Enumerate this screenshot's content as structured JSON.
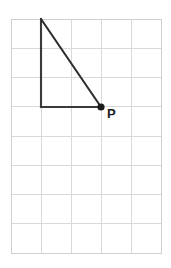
{
  "figure": {
    "background_color": "#ffffff",
    "grid": {
      "columns": 5,
      "rows": 8,
      "cell_width": 30,
      "cell_height": 29.25,
      "origin_x": 11,
      "origin_y": 19,
      "line_color": "#d9d9d9",
      "border_color": "#cfcfcf"
    },
    "shape": {
      "name": "right triangle",
      "stroke_color": "#3a3a3a",
      "stroke_width": 2.1,
      "vertices": [
        {
          "name": "apex",
          "x": 41,
          "y": 19,
          "grid_col": 1,
          "grid_row": 0,
          "labeled": false,
          "label": ""
        },
        {
          "name": "right-angle-corner",
          "x": 41,
          "y": 107,
          "grid_col": 1,
          "grid_row": 3,
          "labeled": false,
          "label": ""
        },
        {
          "name": "point-p",
          "x": 101,
          "y": 107,
          "grid_col": 3,
          "grid_row": 3,
          "labeled": true,
          "label": "P"
        }
      ],
      "legs": {
        "vertical_length_cells": 3,
        "horizontal_length_cells": 2
      }
    },
    "labels": [
      {
        "name": "point-p-label",
        "text": "P",
        "x": 107,
        "y": 108,
        "color": "#1b1b1b"
      }
    ],
    "markers": [
      {
        "name": "point-p-dot",
        "x": 101,
        "y": 107,
        "radius": 3.6,
        "color": "#1b1b1b"
      }
    ]
  }
}
